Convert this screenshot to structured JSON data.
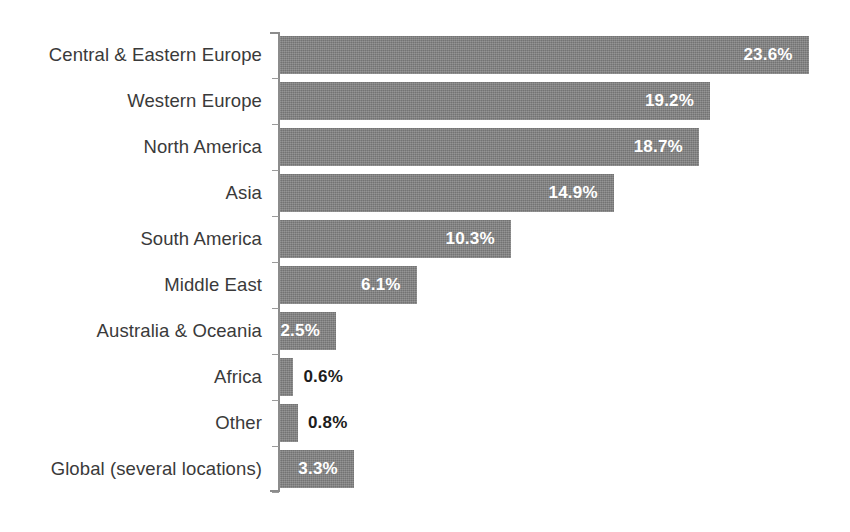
{
  "chart_data": {
    "type": "bar",
    "orientation": "horizontal",
    "title": "",
    "subtitle": "",
    "xlabel": "",
    "ylabel": "",
    "grid": false,
    "legend": null,
    "value_suffix": "%",
    "xlim": [
      0,
      23.6
    ],
    "categories": [
      "Central & Eastern Europe",
      "Western Europe",
      "North America",
      "Asia",
      "South America",
      "Middle East",
      "Australia & Oceania",
      "Africa",
      "Other",
      "Global (several locations)"
    ],
    "values": [
      23.6,
      19.2,
      18.7,
      14.9,
      10.3,
      6.1,
      2.5,
      0.6,
      0.8,
      3.3
    ],
    "value_labels": [
      "23.6%",
      "19.2%",
      "18.7%",
      "14.9%",
      "10.3%",
      "6.1%",
      "2.5%",
      "0.6%",
      "0.8%",
      "3.3%"
    ],
    "label_placement": [
      "inside",
      "inside",
      "inside",
      "inside",
      "inside",
      "inside",
      "inside",
      "outside",
      "outside",
      "inside"
    ],
    "colors": {
      "bar_fill": "#7d7d7d",
      "axis": "#8c8c8c",
      "category_text": "#3a3a3a",
      "value_text_inside": "#ffffff",
      "value_text_outside": "#1d1d1d",
      "background": "#ffffff"
    }
  }
}
